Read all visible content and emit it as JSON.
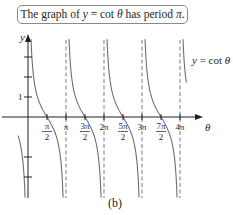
{
  "caption": {
    "prefix": "The graph of ",
    "y": "y",
    "eq": " = cot ",
    "theta": "θ",
    "mid": " has period ",
    "pi": "π",
    "suffix": "."
  },
  "subfigure_label": "(b)",
  "curve_label": {
    "y": "y",
    "rest": " = cot ",
    "theta": "θ"
  },
  "colors": {
    "curve": "#6d6e71",
    "axis": "#231f20",
    "asymptote": "#6d6e71",
    "box_border": "#8a8a8a"
  },
  "chart_data": {
    "type": "line",
    "title": "The graph of y = cot θ has period π.",
    "xlabel": "θ",
    "ylabel": "y",
    "function": "y = cot θ",
    "x_ticks": [
      "π/2",
      "π",
      "3π/2",
      "2π",
      "5π/2",
      "3π",
      "7π/2",
      "4π"
    ],
    "x_tick_values": [
      1.5708,
      3.1416,
      4.7124,
      6.2832,
      7.854,
      9.4248,
      10.9956,
      12.5664
    ],
    "y_ticks": [
      1
    ],
    "y_tick_marks": [
      -3,
      -2,
      1,
      2,
      3
    ],
    "asymptotes": [
      "0",
      "π",
      "2π",
      "3π",
      "4π"
    ],
    "zeros": [
      "π/2",
      "3π/2",
      "5π/2",
      "7π/2"
    ],
    "period": "π",
    "xlim": [
      0,
      13.5
    ],
    "ylim": [
      -4,
      3.6
    ],
    "legend": "y = cot θ",
    "subfigure": "(b)"
  }
}
